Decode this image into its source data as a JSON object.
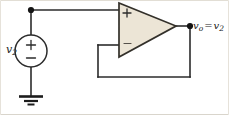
{
  "diagram": {
    "source_label_v": "v",
    "source_label_sub": "2",
    "output_label_v": "v",
    "output_label_sub": "o",
    "output_equals": "=",
    "output_rhs_v": "v",
    "output_rhs_sub": "2",
    "opamp_plus": "+",
    "opamp_minus": "−",
    "source_plus": "+",
    "source_minus": "−",
    "colors": {
      "wire": "#2b2b2b",
      "opamp_fill": "#ece5d6",
      "opamp_stroke": "#33302a",
      "node_dot": "#141414",
      "ground": "#1c1c1c",
      "frame": "#d6d2c9",
      "text": "#1a1a1a"
    },
    "geometry": {
      "top_wire_y": 10,
      "left_rail_x": 31,
      "source_cx": 44,
      "source_cy": 51,
      "source_r": 16,
      "ground_y": 96,
      "opamp_left_x": 118,
      "opamp_right_x": 175,
      "opamp_top_y": 3,
      "opamp_bottom_y": 57,
      "output_node_x": 190,
      "output_node_y": 26,
      "feedback_left_x": 98,
      "feedback_bottom_y": 77,
      "minus_input_y": 45
    }
  }
}
